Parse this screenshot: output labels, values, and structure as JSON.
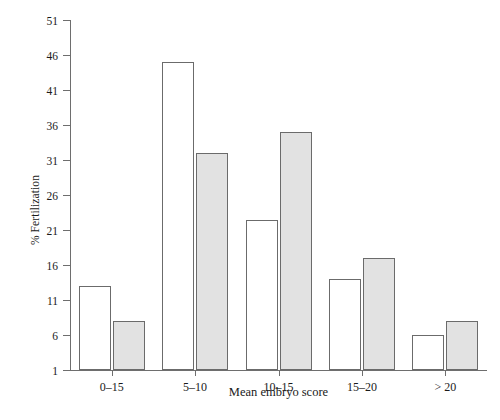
{
  "chart_data": {
    "type": "bar",
    "title": "",
    "xlabel": "Mean embryo score",
    "ylabel": "% Fertilization",
    "categories": [
      "0–15",
      "5–10",
      "10–15",
      "15–20",
      "> 20"
    ],
    "series": [
      {
        "name": "series-1",
        "style": "white",
        "values": [
          13,
          45,
          22.5,
          14,
          6
        ]
      },
      {
        "name": "series-2",
        "style": "gray",
        "values": [
          8,
          32,
          35,
          17,
          8
        ]
      }
    ],
    "ylim": [
      1,
      51
    ],
    "yticks": [
      1,
      6,
      11,
      16,
      21,
      26,
      31,
      36,
      41,
      46,
      51
    ],
    "ytick_labels": [
      "1",
      "6",
      "11",
      "16",
      "21",
      "26",
      "31",
      "36",
      "41",
      "46",
      "51"
    ],
    "grid": false,
    "legend": "none",
    "colors": {
      "series_white_fill": "#ffffff",
      "series_gray_fill": "#e2e2e2",
      "bar_outline": "#6b6b6b",
      "axis": "#6e6e6e",
      "text": "#1a1a1a",
      "background": "#ffffff"
    }
  }
}
